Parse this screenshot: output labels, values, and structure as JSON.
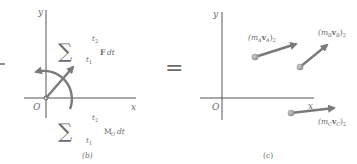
{
  "panel_b": {
    "caption": "(b)",
    "axis_y": "y",
    "axis_x": "x",
    "origin": "O",
    "impulse_force": {
      "sigma": "∑",
      "upper": "t",
      "upper_sub": "2",
      "lower": "t",
      "lower_sub": "1",
      "integrand": "F",
      "dt": "dt"
    },
    "impulse_moment": {
      "sigma": "∑",
      "upper": "t",
      "upper_sub": "2",
      "lower": "t",
      "lower_sub": "1",
      "integrand": "M",
      "integrand_sub": "O",
      "dt": "dt"
    }
  },
  "equals": "=",
  "panel_c": {
    "caption": "(c)",
    "axis_y": "y",
    "axis_x": "x",
    "origin": "O",
    "momenta": [
      {
        "label": "(m",
        "sub1": "A",
        "v": "v",
        "sub2": "A",
        "close": ")",
        "sub3": "2"
      },
      {
        "label": "(m",
        "sub1": "B",
        "v": "v",
        "sub2": "B",
        "close": ")",
        "sub3": "2"
      },
      {
        "label": "(m",
        "sub1": "C",
        "v": "v",
        "sub2": "C",
        "close": ")",
        "sub3": "2"
      }
    ]
  },
  "colors": {
    "vector": "#7a7a7a",
    "particle": "#9a9a9a",
    "axis": "#555555",
    "text": "#6a6a6a"
  }
}
